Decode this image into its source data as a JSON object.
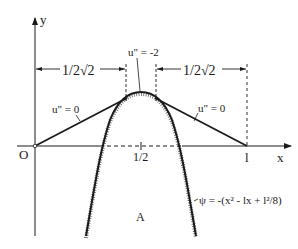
{
  "diagram": {
    "type": "obstacle-problem-sketch",
    "axes": {
      "x_label": "x",
      "y_label": "y",
      "origin_label": "O",
      "midpoint_label": "1/2",
      "end_label": "l"
    },
    "dimensions": {
      "left": "1/2√2",
      "right": "1/2√2"
    },
    "annotations": {
      "left_segment": "u\" = 0",
      "right_segment": "u\" = 0",
      "apex": "u\" = -2",
      "region": "A",
      "obstacle_formula": "ψ = -(x² - lx + l²/8)"
    },
    "colors": {
      "ink": "#1a1a1a",
      "background": "#ffffff"
    }
  }
}
